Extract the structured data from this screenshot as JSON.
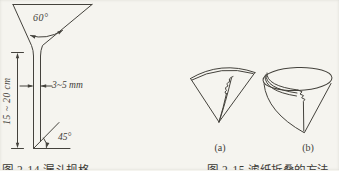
{
  "page": {
    "background_color": "#f5f4ef",
    "ink_color": "#44423c"
  },
  "figure_left": {
    "caption": "图 2-14  漏斗规格",
    "labels": {
      "cone_angle": "60°",
      "stem_width": "3~5 mm",
      "stem_length": "15 ~ 20 cm",
      "tip_angle": "45°"
    }
  },
  "figure_right": {
    "caption": "图 2-15  滤纸折叠的方法",
    "labels": {
      "a": "(a)",
      "b": "(b)"
    }
  }
}
